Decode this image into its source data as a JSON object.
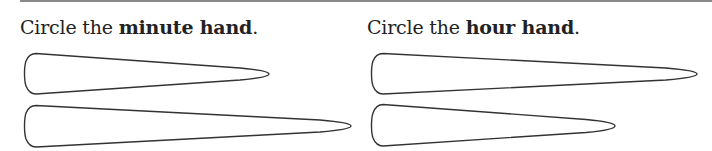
{
  "worksheet": {
    "questions": [
      {
        "prefix": "Circle the ",
        "emphasis": "minute hand",
        "suffix": ".",
        "options": [
          {
            "label": "hand-option-short",
            "length": "short"
          },
          {
            "label": "hand-option-long",
            "length": "long"
          }
        ]
      },
      {
        "prefix": "Circle the ",
        "emphasis": "hour hand",
        "suffix": ".",
        "options": [
          {
            "label": "hand-option-long",
            "length": "long"
          },
          {
            "label": "hand-option-short",
            "length": "short"
          }
        ]
      }
    ],
    "colors": {
      "stroke": "#333333",
      "text": "#222222",
      "rule": "#8a8a8a"
    }
  }
}
